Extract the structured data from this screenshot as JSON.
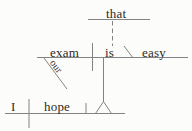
{
  "diagram": {
    "kind": "reed-kellogg-sentence-diagram",
    "words": {
      "that": "that",
      "exam": "exam",
      "is": "is",
      "easy": "easy",
      "our": "our",
      "subject": "I",
      "verb": "hope"
    },
    "colors": {
      "line": "#838383",
      "text": "#2f2a26",
      "background": "#fcfcfb"
    }
  }
}
